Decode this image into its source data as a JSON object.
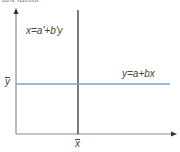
{
  "diagram": {
    "top_cropped_text": "ant factor",
    "regression_x_on_y_label": "x=a'+b'y",
    "regression_y_on_x_label": "y=a+bx",
    "y_mean_label": "y",
    "x_mean_label": "x",
    "colors": {
      "axis": "#8a8a8a",
      "vertical_line": "#333333",
      "horizontal_line": "#6fa3d8",
      "text": "#444444"
    }
  }
}
